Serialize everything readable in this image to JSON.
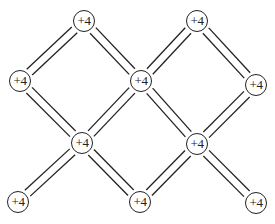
{
  "diagram": {
    "type": "lattice",
    "node_label_default": "+4",
    "edge_style": "double-line",
    "colors": {
      "ink": "#222222",
      "background": "#ffffff"
    },
    "nodes": [
      {
        "id": "n1",
        "label": "+4",
        "x": 84,
        "y": 21
      },
      {
        "id": "n2",
        "label": "+4",
        "x": 197,
        "y": 21
      },
      {
        "id": "n3",
        "label": "+4",
        "x": 20,
        "y": 81
      },
      {
        "id": "n4",
        "label": "+4",
        "x": 141,
        "y": 81
      },
      {
        "id": "n5",
        "label": "+4",
        "x": 256,
        "y": 85
      },
      {
        "id": "n6",
        "label": "+4",
        "x": 82,
        "y": 143
      },
      {
        "id": "n7",
        "label": "+4",
        "x": 197,
        "y": 144
      },
      {
        "id": "n8",
        "label": "+4",
        "x": 18,
        "y": 202
      },
      {
        "id": "n9",
        "label": "+4",
        "x": 140,
        "y": 202
      },
      {
        "id": "n10",
        "label": "+4",
        "x": 256,
        "y": 203
      }
    ],
    "edges": [
      [
        "n1",
        "n3"
      ],
      [
        "n1",
        "n4"
      ],
      [
        "n2",
        "n4"
      ],
      [
        "n2",
        "n5"
      ],
      [
        "n3",
        "n6"
      ],
      [
        "n4",
        "n6"
      ],
      [
        "n4",
        "n7"
      ],
      [
        "n5",
        "n7"
      ],
      [
        "n6",
        "n8"
      ],
      [
        "n6",
        "n9"
      ],
      [
        "n7",
        "n9"
      ],
      [
        "n7",
        "n10"
      ]
    ]
  }
}
